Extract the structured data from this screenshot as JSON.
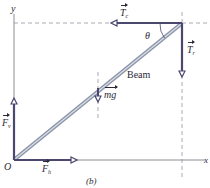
{
  "figure": {
    "label": "(b)",
    "colors": {
      "vector": "#4b4870",
      "beam_outer": "#8a93a6",
      "beam_inner": "#d7dde6",
      "axis": "#8e8e96",
      "dashed": "#a2a2aa",
      "text": "#2a2a35"
    }
  },
  "axes": {
    "y_label": "y",
    "x_label": "x",
    "origin_label": "O"
  },
  "beam": {
    "label": "Beam",
    "angle_label": "θ"
  },
  "forces": {
    "tension_c": {
      "symbol": "T",
      "subscript": "c",
      "direction": "left"
    },
    "tension_r": {
      "symbol": "T",
      "subscript": "r",
      "direction": "down"
    },
    "weight": {
      "symbol": "mg",
      "direction": "down"
    },
    "vertical": {
      "symbol": "F",
      "subscript": "v",
      "direction": "up"
    },
    "horizontal": {
      "symbol": "F",
      "subscript": "h",
      "direction": "right"
    }
  }
}
